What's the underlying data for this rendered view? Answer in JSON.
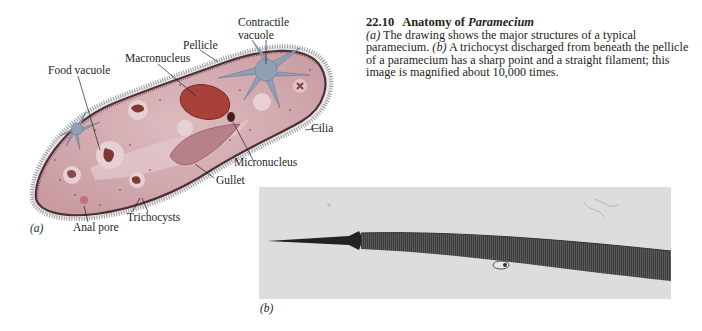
{
  "caption": {
    "number": "22.10",
    "title_prefix": "Anatomy of ",
    "title_italic": "Paramecium",
    "part_a_tag": "(a)",
    "part_a_text": " The drawing shows the major structures of a typical paramecium. ",
    "part_b_tag": "(b)",
    "part_b_text": " A trichocyst discharged from beneath the pellicle of a paramecium has a sharp point and a straight filament; this image is magnified about 10,000 times."
  },
  "figure_a": {
    "panel_label": "(a)",
    "labels": {
      "contractile_vacuole_line1": "Contractile",
      "contractile_vacuole_line2": "vacuole",
      "pellicle": "Pellicle",
      "macronucleus": "Macronucleus",
      "food_vacuole": "Food vacuole",
      "cilia": "Cilia",
      "micronucleus": "Micronucleus",
      "gullet": "Gullet",
      "trichocysts": "Trichocysts",
      "anal_pore": "Anal pore"
    },
    "colors": {
      "body": "#d6adb3",
      "pellicle": "#5a3a40",
      "macronucleus": "#a8413a",
      "contractile_vacuole": "#8f9fb4",
      "gullet": "#b88088"
    }
  },
  "figure_b": {
    "panel_label": "(b)",
    "colors": {
      "background": "#dcdcdc",
      "filament": "#4a4a4a",
      "point": "#222222"
    }
  }
}
